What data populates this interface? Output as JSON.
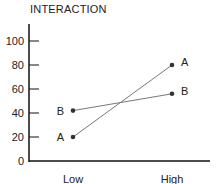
{
  "chart_data": {
    "type": "line",
    "title": "INTERACTION",
    "xlabel": "",
    "ylabel": "",
    "categories": [
      "Low",
      "High"
    ],
    "series": [
      {
        "name": "A",
        "values": [
          20,
          80
        ]
      },
      {
        "name": "B",
        "values": [
          42,
          56
        ]
      }
    ],
    "ylim": [
      0,
      110
    ],
    "yticks": [
      0,
      20,
      40,
      60,
      80,
      100
    ],
    "grid": false,
    "legend": "none (series labeled at points)"
  }
}
